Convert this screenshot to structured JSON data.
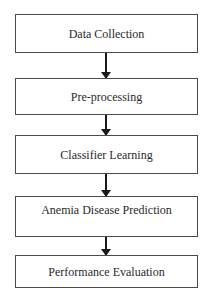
{
  "diagram": {
    "type": "flowchart",
    "direction": "top-to-bottom",
    "steps": [
      {
        "label": "Data Collection"
      },
      {
        "label": "Pre-processing"
      },
      {
        "label": "Classifier Learning"
      },
      {
        "label": "Anemia Disease Prediction"
      },
      {
        "label": "Performance Evaluation"
      }
    ],
    "edges": [
      {
        "from": "Data Collection",
        "to": "Pre-processing"
      },
      {
        "from": "Pre-processing",
        "to": "Classifier Learning"
      },
      {
        "from": "Classifier Learning",
        "to": "Anemia Disease Prediction"
      },
      {
        "from": "Anemia Disease Prediction",
        "to": "Performance Evaluation"
      }
    ],
    "colors": {
      "box_border": "#4a4a4a",
      "arrow": "#1a1a1a",
      "text": "#2a2a2a",
      "background": "#ffffff"
    }
  }
}
